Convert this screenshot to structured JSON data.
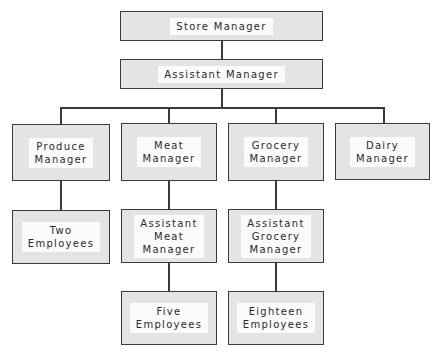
{
  "chart": {
    "title": "",
    "nodes": [
      {
        "id": "store-manager",
        "label": "Store Manager",
        "parent": null
      },
      {
        "id": "assistant-manager",
        "label": "Assistant Manager",
        "parent": "store-manager"
      },
      {
        "id": "produce-manager",
        "label": "Produce\nManager",
        "parent": "assistant-manager"
      },
      {
        "id": "meat-manager",
        "label": "Meat\nManager",
        "parent": "assistant-manager"
      },
      {
        "id": "grocery-manager",
        "label": "Grocery\nManager",
        "parent": "assistant-manager"
      },
      {
        "id": "dairy-manager",
        "label": "Dairy\nManager",
        "parent": "assistant-manager"
      },
      {
        "id": "produce-employees",
        "label": "Two\nEmployees",
        "parent": "produce-manager"
      },
      {
        "id": "assistant-meat-manager",
        "label": "Assistant\nMeat\nManager",
        "parent": "meat-manager"
      },
      {
        "id": "assistant-grocery-manager",
        "label": "Assistant\nGrocery\nManager",
        "parent": "grocery-manager"
      },
      {
        "id": "meat-employees",
        "label": "Five\nEmployees",
        "parent": "assistant-meat-manager"
      },
      {
        "id": "grocery-employees",
        "label": "Eighteen\nEmployees",
        "parent": "assistant-grocery-manager"
      }
    ]
  }
}
